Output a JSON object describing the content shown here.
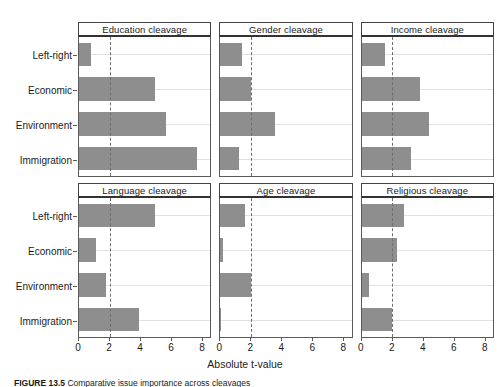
{
  "figure": {
    "x_axis_title": "Absolute t-value",
    "caption_prefix": "FIGURE 13.5",
    "caption_text": "Comparative issue importance across cleavages"
  },
  "axis": {
    "x_ticks": [
      0,
      2,
      4,
      6,
      8
    ],
    "x_min": 0,
    "x_max": 8.6,
    "reference_value": 2,
    "categories": [
      "Left-right",
      "Economic",
      "Environment",
      "Immigration"
    ]
  },
  "colors": {
    "bar_fill": "#8e8e8e",
    "panel_border": "#5a5a5a",
    "strip_border": "#444444",
    "gridline": "#e2e2e2",
    "refline": "#6e6e6e",
    "background": "#ffffff",
    "text": "#1a1a1a"
  },
  "chart_data": {
    "type": "bar",
    "title": "",
    "xlabel": "Absolute t-value",
    "ylabel": "",
    "xlim": [
      0,
      8.6
    ],
    "grid": true,
    "legend": "none",
    "orientation": "horizontal",
    "reference_line": 2,
    "categories": [
      "Left-right",
      "Economic",
      "Environment",
      "Immigration"
    ],
    "panels": [
      {
        "title": "Education cleavage",
        "values": [
          0.8,
          5.0,
          5.7,
          7.7
        ]
      },
      {
        "title": "Gender cleavage",
        "values": [
          1.4,
          2.0,
          3.6,
          1.25
        ]
      },
      {
        "title": "Income cleavage",
        "values": [
          1.5,
          3.8,
          4.4,
          3.2
        ]
      },
      {
        "title": "Language cleavage",
        "values": [
          5.0,
          1.1,
          1.75,
          3.9
        ]
      },
      {
        "title": "Age cleavage",
        "values": [
          1.6,
          0.15,
          2.0,
          0.05
        ]
      },
      {
        "title": "Religious cleavage",
        "values": [
          2.8,
          2.3,
          0.45,
          2.0
        ]
      }
    ]
  }
}
